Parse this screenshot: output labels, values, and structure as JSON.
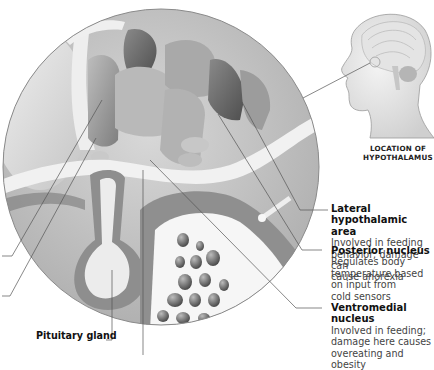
{
  "figure": {
    "inset": {
      "caption_line1": "LOCATION OF",
      "caption_line2": "HYPOTHALAMUS"
    },
    "labels": [
      {
        "title": "Lateral hypothalamic area",
        "title_line1": "Lateral hypothalamic",
        "title_line2": "area",
        "description_lines": [
          "Involved in feeding",
          "behavior; damage can",
          "cause anorexia"
        ]
      },
      {
        "title": "Posterior nucleus",
        "title_line1": "Posterior nucleus",
        "description_lines": [
          "Regulates body",
          "temperature based",
          "on input from",
          "cold sensors"
        ]
      },
      {
        "title": "Ventromedial nucleus",
        "title_line1": "Ventromedial nucleus",
        "description_lines": [
          "Involved in feeding;",
          "damage here causes",
          "overeating and obesity"
        ]
      }
    ],
    "bottom_labels": [
      {
        "title": "Pituitary gland"
      }
    ]
  },
  "colors": {
    "background": "#ffffff",
    "leader_line": "#555555",
    "circle_border": "#8a8a8a"
  }
}
